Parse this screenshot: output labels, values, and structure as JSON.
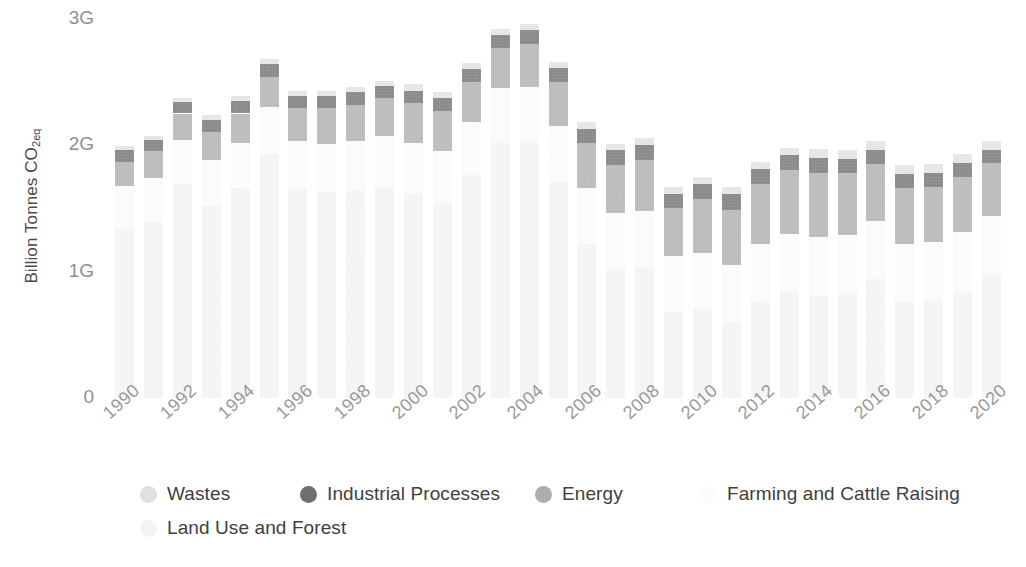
{
  "chart_data": {
    "type": "bar",
    "stacked": true,
    "title": "",
    "subtitle": "",
    "xlabel": "",
    "ylabel": "Billion Tonnes CO2eq",
    "ylabel_display": "Billion Tonnes CO",
    "ylabel_subscript": "2eq",
    "ylim": [
      0,
      3.1
    ],
    "ytick_values": [
      0,
      1,
      2,
      3
    ],
    "ytick_labels": [
      "0",
      "1G",
      "2G",
      "3G"
    ],
    "grid": false,
    "legend_position": "bottom",
    "categories": [
      "1990",
      "1991",
      "1992",
      "1993",
      "1994",
      "1995",
      "1996",
      "1997",
      "1998",
      "1999",
      "2000",
      "2001",
      "2002",
      "2003",
      "2004",
      "2005",
      "2006",
      "2007",
      "2008",
      "2009",
      "2010",
      "2011",
      "2012",
      "2013",
      "2014",
      "2015",
      "2016",
      "2017",
      "2018",
      "2019",
      "2020"
    ],
    "xtick_labels": [
      "1990",
      "1992",
      "1994",
      "1996",
      "1998",
      "2000",
      "2002",
      "2004",
      "2006",
      "2008",
      "2010",
      "2012",
      "2014",
      "2016",
      "2018",
      "2020"
    ],
    "series": [
      {
        "name": "Land Use and Forest",
        "color": "#f2f2f2",
        "values": [
          1.34,
          1.39,
          1.69,
          1.52,
          1.66,
          1.93,
          1.65,
          1.63,
          1.64,
          1.67,
          1.62,
          1.54,
          1.76,
          2.02,
          2.02,
          1.71,
          1.22,
          1.02,
          1.04,
          0.68,
          0.7,
          0.6,
          0.77,
          0.85,
          0.81,
          0.83,
          0.94,
          0.76,
          0.77,
          0.84,
          0.97
        ]
      },
      {
        "name": "Farming and Cattle Raising",
        "color": "#fafafa",
        "values": [
          0.34,
          0.35,
          0.35,
          0.36,
          0.36,
          0.37,
          0.38,
          0.38,
          0.39,
          0.4,
          0.4,
          0.41,
          0.42,
          0.43,
          0.44,
          0.44,
          0.44,
          0.44,
          0.44,
          0.44,
          0.45,
          0.45,
          0.45,
          0.45,
          0.46,
          0.46,
          0.46,
          0.46,
          0.46,
          0.47,
          0.47
        ]
      },
      {
        "name": "Energy",
        "color": "#adadad",
        "values": [
          0.19,
          0.21,
          0.21,
          0.22,
          0.23,
          0.24,
          0.26,
          0.28,
          0.29,
          0.3,
          0.31,
          0.32,
          0.32,
          0.32,
          0.34,
          0.35,
          0.36,
          0.38,
          0.4,
          0.38,
          0.42,
          0.44,
          0.47,
          0.5,
          0.51,
          0.49,
          0.45,
          0.44,
          0.44,
          0.44,
          0.42
        ]
      },
      {
        "name": "Industrial Processes",
        "color": "#6f6f6f",
        "values": [
          0.09,
          0.09,
          0.09,
          0.1,
          0.1,
          0.1,
          0.1,
          0.1,
          0.1,
          0.1,
          0.1,
          0.1,
          0.1,
          0.1,
          0.11,
          0.11,
          0.11,
          0.12,
          0.12,
          0.11,
          0.12,
          0.12,
          0.12,
          0.12,
          0.12,
          0.11,
          0.11,
          0.11,
          0.11,
          0.11,
          0.1
        ]
      },
      {
        "name": "Wastes",
        "color": "#e0e0e0",
        "values": [
          0.03,
          0.03,
          0.03,
          0.04,
          0.04,
          0.04,
          0.04,
          0.04,
          0.04,
          0.04,
          0.05,
          0.05,
          0.05,
          0.05,
          0.05,
          0.05,
          0.05,
          0.05,
          0.06,
          0.06,
          0.06,
          0.06,
          0.06,
          0.06,
          0.07,
          0.07,
          0.07,
          0.07,
          0.07,
          0.07,
          0.07
        ]
      }
    ]
  },
  "legend": {
    "rows": [
      [
        {
          "label": "Wastes",
          "color": "#e0e0e0",
          "offset": 0
        },
        {
          "label": "Industrial Processes",
          "color": "#6f6f6f",
          "offset": 160
        },
        {
          "label": "Energy",
          "color": "#adadad",
          "offset": 395
        },
        {
          "label": "Farming and Cattle Raising",
          "color": "#fcfcfc",
          "offset": 560
        }
      ],
      [
        {
          "label": "Land Use and Forest",
          "color": "#f4f4f4",
          "offset": 0
        }
      ]
    ]
  }
}
